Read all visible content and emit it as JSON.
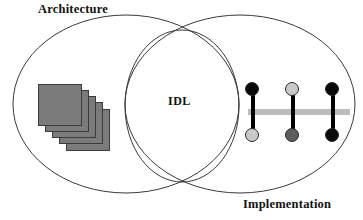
{
  "diagram": {
    "title_architecture": "Architecture",
    "title_implementation": "Implementation",
    "center_label": "IDL",
    "shapes": {
      "left_ellipse": {
        "name": "architecture-ellipse",
        "cx": 126,
        "cy": 104,
        "rx": 113,
        "ry": 89
      },
      "right_ellipse": {
        "name": "implementation-ellipse",
        "cx": 240,
        "cy": 104,
        "rx": 115,
        "ry": 89
      },
      "center_circle": {
        "name": "idl-circle",
        "cx": 182,
        "cy": 106,
        "rx": 57,
        "ry": 76
      }
    },
    "colors": {
      "outline": "#3a3a3a",
      "card_fill": "#7b7b7b",
      "card_border": "#3b3b3b",
      "bar": "#bdbdbd",
      "node_black": "#0a0a0a",
      "node_light_gray": "#c9c9c9",
      "node_dark_gray": "#5e5e5e",
      "background": "#ffffff",
      "text": "#111111"
    },
    "layer_stack": {
      "name": "stacked-layers-icon",
      "count": 5,
      "cards": [
        {
          "left": 0,
          "top": 0,
          "z": 5
        },
        {
          "left": 7,
          "top": 6,
          "z": 4
        },
        {
          "left": 14,
          "top": 12,
          "z": 3
        },
        {
          "left": 21,
          "top": 18,
          "z": 2
        },
        {
          "left": 28,
          "top": 25,
          "z": 1
        }
      ]
    },
    "connector_group": {
      "name": "connector-nodes-icon",
      "bar_label": "horizontal-bus-bar",
      "dumbbells": [
        {
          "name": "dumbbell-1",
          "left": 2,
          "top_node_color": "#0a0a0a",
          "bottom_node_color": "#c9c9c9"
        },
        {
          "name": "dumbbell-2",
          "left": 42,
          "top_node_color": "#c9c9c9",
          "bottom_node_color": "#5e5e5e"
        },
        {
          "name": "dumbbell-3",
          "left": 82,
          "top_node_color": "#0a0a0a",
          "bottom_node_color": "#0a0a0a"
        }
      ]
    }
  }
}
